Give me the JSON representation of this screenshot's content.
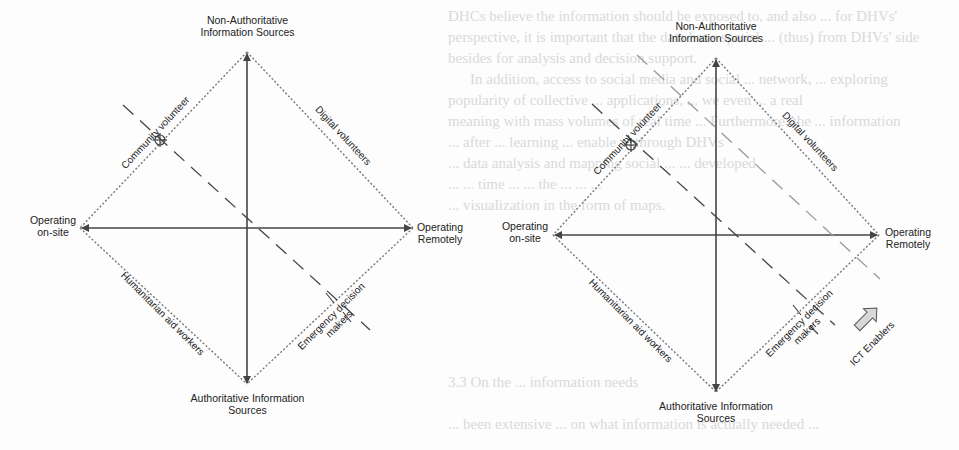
{
  "background_text": {
    "lines": [
      "DHCs believe the information should be exposed to, and also ... for DHVs'",
      "perspective, it is important that the data have spatial ... (thus) from DHVs' side",
      "besides for analysis and decision support.",
      "In addition, access to social media and social ... network, ... exploring",
      "popularity of collective ... applications, ... we even ... a real",
      "meaning with mass volumes of real time ... Furthermore, the ... information",
      "... after ... learning ... enable ... through DHVs",
      "... data analysis and mapping social ... ... developed",
      "... ... time ... ... the ... ... ...",
      "... visualization in the form of maps.",
      "3.3   On the ... information needs",
      "... been extensive ... on what information is actually needed ..."
    ]
  },
  "diagrams": [
    {
      "id": "left",
      "axis_top": "Non-Authoritative\nInformation Sources",
      "axis_bottom": "Authoritative Information\nSources",
      "axis_left": "Operating\non-site",
      "axis_right": "Operating\nRemotely",
      "edges": {
        "top_left": "Community volunteer",
        "top_right": "Digital volunteers",
        "bottom_left": "Humanitarian aid workers",
        "bottom_right": "Emergency decision\nmakers"
      },
      "marker": "crosshair-circle on Community volunteer edge"
    },
    {
      "id": "right",
      "axis_top": "Non-Authoritative\nInformation Sources",
      "axis_bottom": "Authoritative Information\nSources",
      "axis_left": "Operating\non-site",
      "axis_right": "Operating\nRemotely",
      "edges": {
        "top_left": "Community volunteer",
        "top_right": "Digital volunteers",
        "bottom_left": "Humanitarian aid workers",
        "bottom_right": "Emergency decision\nmakers"
      },
      "enabler_arrow": "ICT Enablers",
      "marker": "crosshair-circle on Community volunteer edge"
    }
  ],
  "colors": {
    "axis": "#444444",
    "dotted_edge": "#777777",
    "dashed_line": "#555555",
    "dashed_line_light": "#999999",
    "enabler_arrow_fill": "#d8d8d8",
    "bg_text": "#d9d9d9"
  }
}
